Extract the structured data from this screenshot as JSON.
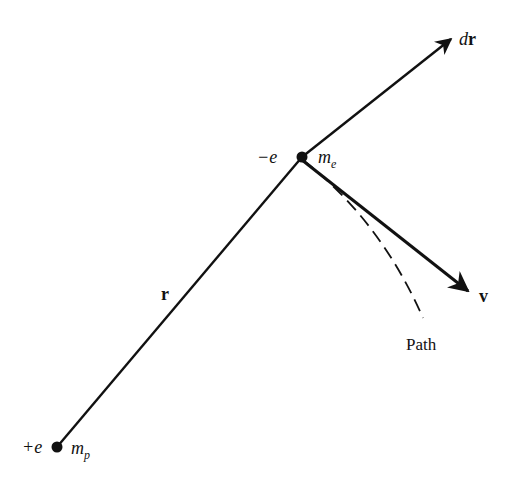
{
  "figure": {
    "colors": {
      "stroke": "#111111",
      "background": "#ffffff"
    }
  },
  "labels": {
    "proton_charge": "+e",
    "proton_mass_base": "m",
    "proton_mass_sub": "p",
    "electron_charge": "−e",
    "electron_mass_base": "m",
    "electron_mass_sub": "e",
    "position_vector": "r",
    "displacement_d": "d",
    "displacement_r": "r",
    "velocity_vector": "v",
    "path": "Path"
  },
  "points": {
    "proton": {
      "x": 57,
      "y": 447
    },
    "electron": {
      "x": 302,
      "y": 157
    },
    "dr_tip": {
      "x": 453,
      "y": 37
    },
    "v_tip": {
      "x": 470,
      "y": 292
    },
    "path_end": {
      "x": 423,
      "y": 318
    }
  }
}
